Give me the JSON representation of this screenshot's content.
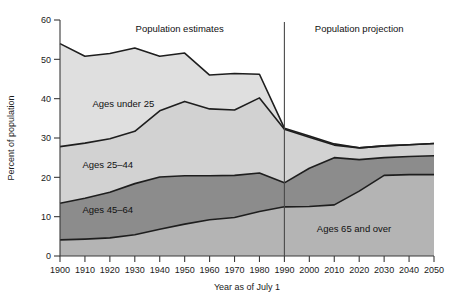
{
  "chart_data": {
    "type": "area",
    "stacked": true,
    "title": "",
    "xlabel": "Year as of July 1",
    "ylabel": "Percent of population",
    "xlim": [
      1900,
      2050
    ],
    "ylim": [
      0,
      60
    ],
    "ytick_step": 10,
    "yticks": [
      0,
      10,
      20,
      30,
      40,
      50,
      60
    ],
    "grid": false,
    "legend": "inline-band-labels",
    "x": [
      1900,
      1910,
      1920,
      1930,
      1940,
      1950,
      1960,
      1970,
      1980,
      1990,
      2000,
      2010,
      2020,
      2030,
      2040,
      2050
    ],
    "categories": [
      "1900",
      "1910",
      "1920",
      "1930",
      "1940",
      "1950",
      "1960",
      "1970",
      "1980",
      "1990",
      "2000",
      "2010",
      "2020",
      "2030",
      "2040",
      "2050"
    ],
    "series": [
      {
        "name": "Ages 65 and over",
        "order": 1,
        "color": "#b4b4b4",
        "values": [
          4.1,
          4.3,
          4.6,
          5.4,
          6.8,
          8.1,
          9.2,
          9.8,
          11.3,
          12.5,
          12.6,
          13.0,
          16.5,
          20.5,
          20.7,
          20.7
        ]
      },
      {
        "name": "Ages 45–64",
        "order": 2,
        "color": "#8c8c8c",
        "values": [
          9.3,
          10.4,
          11.6,
          13.0,
          13.3,
          12.3,
          11.2,
          10.7,
          9.8,
          6.1,
          9.7,
          12.0,
          8.0,
          4.5,
          4.6,
          4.8
        ]
      },
      {
        "name": "Ages 25–44",
        "order": 3,
        "color": "#d2d2d2",
        "values": [
          14.4,
          14.0,
          13.6,
          13.3,
          16.8,
          18.9,
          17.0,
          16.6,
          19.1,
          13.6,
          7.9,
          3.2,
          3.0,
          3.0,
          3.0,
          3.1
        ]
      },
      {
        "name": "Ages under 25",
        "order": 4,
        "color": "#dfdfdf",
        "values": [
          26.2,
          22.1,
          21.7,
          21.2,
          13.9,
          12.3,
          8.6,
          9.3,
          6.0,
          0.3,
          0.3,
          0.3,
          0.0,
          0.0,
          0.0,
          0.0
        ]
      }
    ],
    "cumulative_boundaries": {
      "note": "running totals used to draw the stacked bands",
      "b65": [
        4.1,
        4.3,
        4.6,
        5.4,
        6.8,
        8.1,
        9.2,
        9.8,
        11.3,
        12.5,
        12.6,
        13.0,
        16.5,
        20.5,
        20.7,
        20.7
      ],
      "b45": [
        13.4,
        14.7,
        16.2,
        18.4,
        20.1,
        20.4,
        20.4,
        20.5,
        21.1,
        18.6,
        22.3,
        25.0,
        24.5,
        25.0,
        25.3,
        25.5
      ],
      "b25": [
        27.8,
        28.7,
        29.8,
        31.7,
        36.9,
        39.3,
        37.4,
        37.1,
        40.2,
        32.2,
        30.2,
        28.2,
        27.5,
        28.0,
        28.3,
        28.6
      ],
      "btop": [
        54.0,
        50.8,
        51.5,
        52.9,
        50.8,
        51.6,
        46.0,
        46.4,
        46.2,
        32.5,
        30.5,
        28.5,
        27.5,
        28.0,
        28.3,
        28.6
      ]
    },
    "annotations": [
      {
        "name": "estimates-label",
        "text": "Population estimates",
        "x_year": 1948,
        "y_value": 57
      },
      {
        "name": "projection-label",
        "text": "Population projection",
        "x_year": 2020,
        "y_value": 57
      },
      {
        "name": "divider",
        "text": "",
        "x_year": 1990,
        "type": "vertical-line"
      }
    ],
    "band_labels": [
      {
        "name": "ages-under-25-label",
        "text": "Ages under 25",
        "x_year": 1913,
        "y_value": 38
      },
      {
        "name": "ages-25-44-label",
        "text": "Ages 25–44",
        "x_year": 1909,
        "y_value": 22.5
      },
      {
        "name": "ages-45-64-label",
        "text": "Ages 45–64",
        "x_year": 1909,
        "y_value": 11
      },
      {
        "name": "ages-65-over-label",
        "text": "Ages 65 and over",
        "x_year": 2003,
        "y_value": 6
      }
    ]
  },
  "colors": {
    "ages_under_25": "#dfdfdf",
    "ages_25_44": "#d2d2d2",
    "ages_45_64": "#8c8c8c",
    "ages_65_over": "#b4b4b4",
    "axis": "#3a3a3a",
    "line": "#1e1e1e",
    "background": "#ffffff"
  }
}
